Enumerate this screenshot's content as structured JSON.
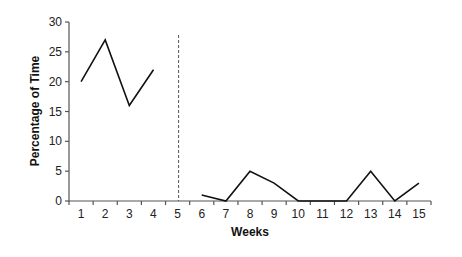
{
  "chart_data": {
    "type": "line",
    "title": "",
    "xlabel": "Weeks",
    "ylabel": "Percentage of Time",
    "categories": [
      "1",
      "2",
      "3",
      "4",
      "5",
      "6",
      "7",
      "8",
      "9",
      "10",
      "11",
      "12",
      "13",
      "14",
      "15"
    ],
    "series": [
      {
        "name": "Phase 1",
        "x": [
          1,
          2,
          3,
          4
        ],
        "values": [
          20,
          27,
          16,
          22
        ]
      },
      {
        "name": "Phase 2",
        "x": [
          6,
          7,
          8,
          9,
          10,
          11,
          12,
          13,
          14,
          15
        ],
        "values": [
          1,
          0,
          5,
          3,
          0,
          0,
          0,
          5,
          0,
          3
        ]
      }
    ],
    "yticks": [
      0,
      5,
      10,
      15,
      20,
      25,
      30
    ],
    "ylim": [
      0,
      30
    ],
    "phase_change_line": {
      "after_week": 5,
      "style": "dashed"
    },
    "grid": false,
    "legend": null,
    "colors": {
      "line": "#111111",
      "axis": "#555555",
      "dashed": "#555555"
    }
  }
}
